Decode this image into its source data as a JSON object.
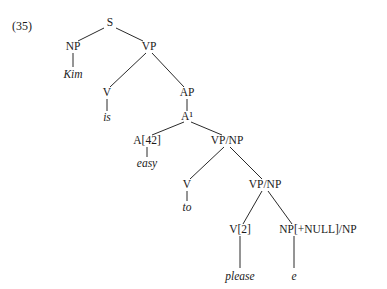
{
  "example_number": "(35)",
  "tree": {
    "nodes": [
      {
        "id": "S",
        "label": "S",
        "x": 110,
        "y": 23,
        "italic": false
      },
      {
        "id": "NP",
        "label": "NP",
        "x": 73,
        "y": 47,
        "italic": false
      },
      {
        "id": "Kim",
        "label": "Kim",
        "x": 73,
        "y": 75,
        "italic": true
      },
      {
        "id": "VP",
        "label": "VP",
        "x": 149,
        "y": 47,
        "italic": false
      },
      {
        "id": "V1",
        "label": "V",
        "x": 107,
        "y": 93,
        "italic": false
      },
      {
        "id": "is",
        "label": "is",
        "x": 107,
        "y": 118,
        "italic": true
      },
      {
        "id": "AP",
        "label": "AP",
        "x": 187,
        "y": 93,
        "italic": false
      },
      {
        "id": "Abar",
        "label": "A¹",
        "x": 187,
        "y": 117,
        "italic": false
      },
      {
        "id": "A42",
        "label": "A[42]",
        "x": 147,
        "y": 141,
        "italic": false
      },
      {
        "id": "easy",
        "label": "easy",
        "x": 147,
        "y": 164,
        "italic": true
      },
      {
        "id": "VPNP1",
        "label": "VP/NP",
        "x": 227,
        "y": 141,
        "italic": false
      },
      {
        "id": "V2",
        "label": "V",
        "x": 187,
        "y": 185,
        "italic": false
      },
      {
        "id": "to",
        "label": "to",
        "x": 187,
        "y": 208,
        "italic": true
      },
      {
        "id": "VPNP2",
        "label": "VP/NP",
        "x": 265,
        "y": 185,
        "italic": false
      },
      {
        "id": "V_2",
        "label": "V[2]",
        "x": 240,
        "y": 230,
        "italic": false
      },
      {
        "id": "please",
        "label": "please",
        "x": 240,
        "y": 277,
        "italic": true
      },
      {
        "id": "NPnull",
        "label": "NP[+NULL]/NP",
        "x": 318,
        "y": 230,
        "italic": false
      },
      {
        "id": "e",
        "label": "e",
        "x": 294,
        "y": 277,
        "italic": true
      }
    ],
    "edges": [
      {
        "x1": 104,
        "y1": 28,
        "x2": 78,
        "y2": 41
      },
      {
        "x1": 116,
        "y1": 28,
        "x2": 143,
        "y2": 41
      },
      {
        "x1": 73,
        "y1": 53,
        "x2": 73,
        "y2": 67
      },
      {
        "x1": 146,
        "y1": 53,
        "x2": 110,
        "y2": 87
      },
      {
        "x1": 152,
        "y1": 53,
        "x2": 184,
        "y2": 87
      },
      {
        "x1": 107,
        "y1": 99,
        "x2": 107,
        "y2": 111
      },
      {
        "x1": 187,
        "y1": 99,
        "x2": 187,
        "y2": 111
      },
      {
        "x1": 184,
        "y1": 122,
        "x2": 152,
        "y2": 135
      },
      {
        "x1": 191,
        "y1": 122,
        "x2": 222,
        "y2": 135
      },
      {
        "x1": 147,
        "y1": 147,
        "x2": 147,
        "y2": 157
      },
      {
        "x1": 224,
        "y1": 147,
        "x2": 190,
        "y2": 179
      },
      {
        "x1": 230,
        "y1": 147,
        "x2": 262,
        "y2": 179
      },
      {
        "x1": 187,
        "y1": 191,
        "x2": 187,
        "y2": 201
      },
      {
        "x1": 262,
        "y1": 191,
        "x2": 243,
        "y2": 224
      },
      {
        "x1": 268,
        "y1": 191,
        "x2": 292,
        "y2": 224
      },
      {
        "x1": 240,
        "y1": 236,
        "x2": 240,
        "y2": 268
      },
      {
        "x1": 294,
        "y1": 236,
        "x2": 294,
        "y2": 268
      }
    ]
  }
}
